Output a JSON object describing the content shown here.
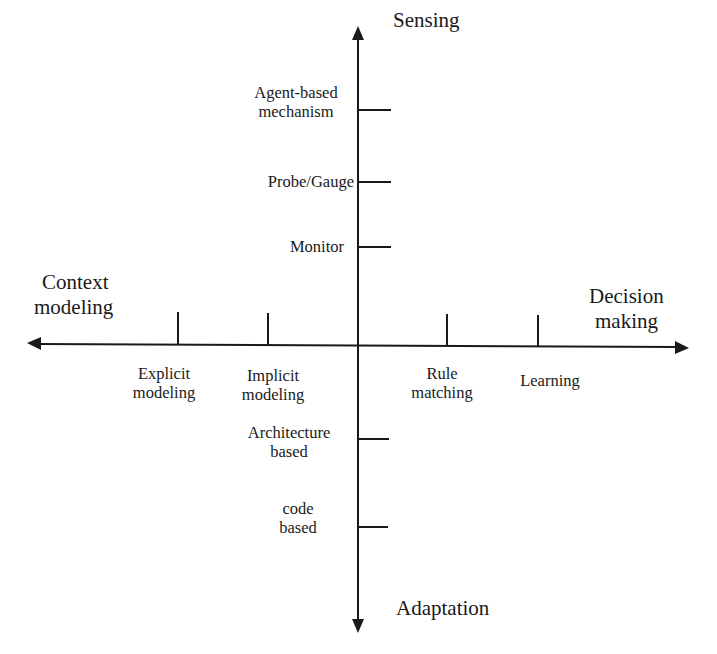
{
  "diagram": {
    "axes": {
      "up": "Sensing",
      "down": "Adaptation",
      "left_line1": "Context",
      "left_line2": "modeling",
      "right_line1": "Decision",
      "right_line2": "making"
    },
    "sensing_ticks": [
      {
        "line1": "Agent-based",
        "line2": "mechanism"
      },
      {
        "line1": "Probe/Gauge"
      },
      {
        "line1": "Monitor"
      }
    ],
    "context_modeling_ticks": [
      {
        "line1": "Explicit",
        "line2": "modeling"
      },
      {
        "line1": "Implicit",
        "line2": "modeling"
      }
    ],
    "decision_making_ticks": [
      {
        "line1": "Rule",
        "line2": "matching"
      },
      {
        "line1": "Learning"
      }
    ],
    "adaptation_ticks": [
      {
        "line1": "Architecture",
        "line2": "based"
      },
      {
        "line1": "code",
        "line2": "based"
      }
    ],
    "colors": {
      "ink": "#1a1a1a",
      "background": "#ffffff"
    }
  }
}
